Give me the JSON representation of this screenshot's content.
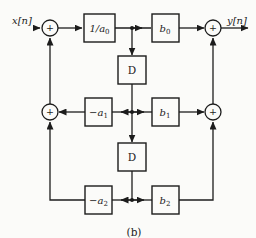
{
  "figure": {
    "caption": "(b)",
    "input_label": "x[n]",
    "output_label": "y[n]",
    "adder_symbol": "+",
    "blocks": {
      "inv_a0": {
        "base": "1/a",
        "sub": "0"
      },
      "b0": {
        "base": "b",
        "sub": "0"
      },
      "delay1": "D",
      "neg_a1": {
        "base": "−a",
        "sub": "1"
      },
      "b1": {
        "base": "b",
        "sub": "1"
      },
      "delay2": "D",
      "neg_a2": {
        "base": "−a",
        "sub": "2"
      },
      "b2": {
        "base": "b",
        "sub": "2"
      }
    },
    "colors": {
      "line": "#1c1c1c",
      "paper": "#fbfbf9"
    }
  }
}
